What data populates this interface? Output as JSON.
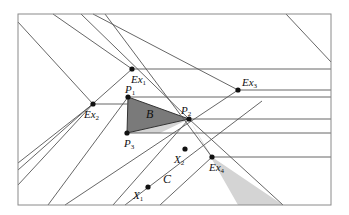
{
  "diagram": {
    "frame": {
      "x1": 18,
      "y1": 14,
      "x2": 331,
      "y2": 205,
      "color": "#8a8a8a"
    },
    "colors": {
      "line": "#555555",
      "triangle_fill": "#7a7a7a",
      "band_fill": "#d4d4d4",
      "point": "#111111"
    },
    "triangle_B": {
      "label": "B",
      "points": [
        [
          128,
          97
        ],
        [
          189,
          119
        ],
        [
          127,
          133
        ]
      ]
    },
    "band_C": {
      "label": "C",
      "polygon": [
        [
          127,
          133
        ],
        [
          189,
          119
        ],
        [
          238,
          205
        ],
        [
          283,
          205
        ],
        [
          212,
          157
        ],
        [
          189,
          119
        ],
        [
          160,
          133
        ],
        [
          127,
          133
        ]
      ]
    },
    "points": [
      {
        "id": "Ex1",
        "base": "Ex",
        "sub": "1",
        "x": 132,
        "y": 69,
        "lx": 131,
        "ly": 74
      },
      {
        "id": "Ex2",
        "base": "Ex",
        "sub": "2",
        "x": 93,
        "y": 104,
        "lx": 84,
        "ly": 109
      },
      {
        "id": "Ex3",
        "base": "Ex",
        "sub": "3",
        "x": 238,
        "y": 90,
        "lx": 242,
        "ly": 77
      },
      {
        "id": "Ex4",
        "base": "Ex",
        "sub": "4",
        "x": 212,
        "y": 157,
        "lx": 209,
        "ly": 162
      },
      {
        "id": "P1",
        "base": "P",
        "sub": "1",
        "x": 128,
        "y": 97,
        "lx": 125,
        "ly": 84
      },
      {
        "id": "P2",
        "base": "P",
        "sub": "2",
        "x": 189,
        "y": 119,
        "lx": 181,
        "ly": 105
      },
      {
        "id": "P3",
        "base": "P",
        "sub": "3",
        "x": 127,
        "y": 133,
        "lx": 124,
        "ly": 138
      },
      {
        "id": "X1",
        "base": "X",
        "sub": "1",
        "x": 148,
        "y": 187,
        "lx": 133,
        "ly": 190
      },
      {
        "id": "X2",
        "base": "X",
        "sub": "2",
        "x": 185,
        "y": 149,
        "lx": 174,
        "ly": 154
      }
    ],
    "labels": {
      "B": "B",
      "C": "C"
    },
    "lines": [
      {
        "x1": 18,
        "y1": 22,
        "x2": 93,
        "y2": 104
      },
      {
        "x1": 53,
        "y1": 14,
        "x2": 132,
        "y2": 69
      },
      {
        "x1": 81,
        "y1": 14,
        "x2": 189,
        "y2": 119
      },
      {
        "x1": 93,
        "y1": 14,
        "x2": 238,
        "y2": 90
      },
      {
        "x1": 105,
        "y1": 14,
        "x2": 212,
        "y2": 157
      },
      {
        "x1": 189,
        "y1": 119,
        "x2": 283,
        "y2": 205
      },
      {
        "x1": 286,
        "y1": 14,
        "x2": 331,
        "y2": 62
      },
      {
        "x1": 132,
        "y1": 69,
        "x2": 331,
        "y2": 69
      },
      {
        "x1": 238,
        "y1": 90,
        "x2": 331,
        "y2": 90
      },
      {
        "x1": 128,
        "y1": 97,
        "x2": 331,
        "y2": 97
      },
      {
        "x1": 93,
        "y1": 104,
        "x2": 128,
        "y2": 104
      },
      {
        "x1": 189,
        "y1": 119,
        "x2": 331,
        "y2": 119
      },
      {
        "x1": 127,
        "y1": 133,
        "x2": 331,
        "y2": 133
      },
      {
        "x1": 212,
        "y1": 157,
        "x2": 331,
        "y2": 157
      },
      {
        "x1": 18,
        "y1": 170,
        "x2": 132,
        "y2": 69
      },
      {
        "x1": 18,
        "y1": 185,
        "x2": 93,
        "y2": 104
      },
      {
        "x1": 18,
        "y1": 163,
        "x2": 93,
        "y2": 104
      },
      {
        "x1": 48,
        "y1": 205,
        "x2": 128,
        "y2": 97
      },
      {
        "x1": 65,
        "y1": 205,
        "x2": 238,
        "y2": 90
      },
      {
        "x1": 113,
        "y1": 205,
        "x2": 189,
        "y2": 119
      },
      {
        "x1": 125,
        "y1": 205,
        "x2": 262,
        "y2": 101
      },
      {
        "x1": 160,
        "y1": 205,
        "x2": 212,
        "y2": 157
      }
    ]
  }
}
